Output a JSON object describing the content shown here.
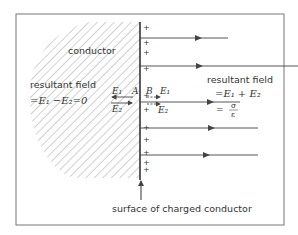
{
  "diagram": {
    "conductor_label": "conductor",
    "left_field": {
      "line1": "resultant field",
      "line2": "=E₁ −E₂=0"
    },
    "right_field": {
      "line1": "resultant field",
      "line2": "=E₁ + E₂",
      "line3_eq": "=",
      "line3_num": "σ",
      "line3_den": "ε"
    },
    "point_A": "A",
    "point_B": "B",
    "vec_E1_left": "E₁",
    "vec_E2_left": "E₂",
    "vec_E1_right": "E₁",
    "vec_E2_right": "E₂",
    "surface_caption": "surface of charged conductor",
    "charge_symbol": "+"
  }
}
